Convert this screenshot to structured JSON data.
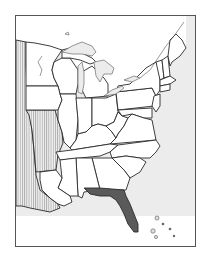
{
  "map": {
    "title": "",
    "region": "Eastern United States",
    "highlighted_state": "Florida",
    "hatched_region": "Western territories",
    "colors": {
      "land": "#ffffff",
      "water": "#ececec",
      "highlight": "#5a5a5a",
      "border": "#2a2a2a",
      "hatch": "#8a8a8a"
    },
    "legend": []
  }
}
